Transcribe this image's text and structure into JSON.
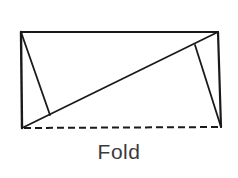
{
  "diagram": {
    "label": "Fold",
    "stroke_color": "#1a1a1a",
    "label_color": "#3a3a3a",
    "rectangle": {
      "top_left": [
        21,
        32
      ],
      "top_right": [
        218,
        32
      ],
      "bottom_right": [
        221,
        127
      ],
      "bottom_left": [
        22,
        128
      ]
    },
    "diagonal": {
      "from": [
        22,
        128
      ],
      "to": [
        218,
        32
      ]
    },
    "perpendiculars": [
      {
        "from": [
          21,
          32
        ],
        "to": [
          50,
          115
        ]
      },
      {
        "from": [
          221,
          127
        ],
        "to": [
          195,
          45
        ]
      }
    ],
    "fold_edge": {
      "from": [
        22,
        128
      ],
      "to": [
        221,
        127
      ],
      "style": "dashed"
    }
  }
}
